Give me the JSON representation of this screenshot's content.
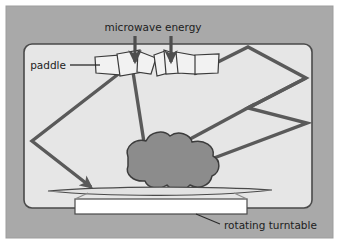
{
  "figure": {
    "background_color": "#a9a9a9",
    "oven_fill_color": "#e6e6e6",
    "oven_border_color": "#4a4a4a",
    "ray_color": "#5a5a5a",
    "food_fill_color": "#8c8c8c",
    "food_border_color": "#3c3c3c",
    "paddle_fill_color": "#f2f2f2",
    "paddle_border_color": "#3a3a3a",
    "plate_fill_color": "#e0e0e0",
    "turntable_fill_color": "#ffffff",
    "label_text_color": "#1d1d1d"
  },
  "labels": {
    "microwave_energy": "microwave energy",
    "paddle": "paddle",
    "rotating_turntable": "rotating turntable"
  },
  "elements": {
    "oven_cavity": "oven cavity",
    "stirrer_paddle_fan": "stirrer paddle fan",
    "food_item": "food item",
    "plate": "plate",
    "turntable_base": "rotating turntable base",
    "energy_arrow_left": "microwave energy entry arrow left",
    "energy_arrow_right": "microwave energy entry arrow right",
    "ray_left_zigzag": "reflected ray path left",
    "ray_right_zigzag": "reflected ray path right",
    "ray_direct_down": "direct ray into food"
  },
  "geometry": {
    "canvas": {
      "width": 339,
      "height": 244
    },
    "oven_box": {
      "x": 24,
      "y": 44,
      "width": 288,
      "height": 164,
      "radius": 7
    },
    "food_center": {
      "x": 168,
      "y": 166
    },
    "plate": {
      "left": 48,
      "right": 272,
      "y": 192
    },
    "turntable": {
      "x": 75,
      "y": 199,
      "width": 172,
      "height": 15
    }
  }
}
